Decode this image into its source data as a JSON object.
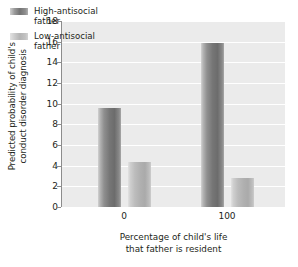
{
  "chart_data": {
    "type": "bar",
    "title": "",
    "categories": [
      "0",
      "100"
    ],
    "xlabel_lines": [
      "Percentage of child's life",
      "that father is resident"
    ],
    "xlabel": "Percentage of child's life that father is resident",
    "ylabel_lines": [
      "Predicted probability of child's",
      "conduct disorder diagnosis"
    ],
    "ylabel": "Predicted probability of child's conduct disorder diagnosis",
    "ylim": [
      0,
      18
    ],
    "yticks": [
      0,
      2,
      4,
      6,
      8,
      10,
      12,
      14,
      16,
      18
    ],
    "ytick_labels": [
      "0",
      "2",
      "4",
      "6",
      "8",
      "10",
      "12",
      "14",
      "16",
      "18"
    ],
    "grid": true,
    "grid_color": "#ffffff",
    "plot_background": "#ebebeb",
    "legend_position": "top-left",
    "series": [
      {
        "name": "High-antisocial father",
        "name_lines": [
          "High-antisocial",
          "father"
        ],
        "color": "#767676",
        "values": [
          9.6,
          15.9
        ]
      },
      {
        "name": "Low-antisocial father",
        "name_lines": [
          "Low-antisocial",
          "father"
        ],
        "color": "#b0b0b0",
        "values": [
          4.35,
          2.85
        ]
      }
    ]
  }
}
